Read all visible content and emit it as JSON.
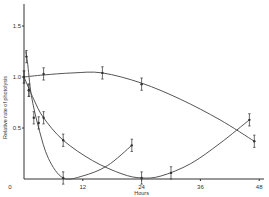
{
  "chart_data": {
    "type": "line",
    "title": "",
    "xlabel": "Hours",
    "ylabel": "Relative rate of photolysis",
    "xlim": [
      0,
      48
    ],
    "ylim": [
      0,
      1.5
    ],
    "x_ticks": [
      "0",
      "12",
      "24",
      "36",
      "48"
    ],
    "y_ticks": [
      "0",
      "0.5",
      "1.0",
      "1.5"
    ],
    "grid": false,
    "legend": null,
    "series": [
      {
        "name": "curve-a",
        "points": [
          [
            0,
            1.0
          ],
          [
            4,
            1.03
          ],
          [
            16,
            1.04
          ],
          [
            24,
            0.93
          ],
          [
            47,
            0.37
          ]
        ],
        "curve": [
          [
            0,
            1.0
          ],
          [
            4,
            1.02
          ],
          [
            10,
            1.04
          ],
          [
            16,
            1.04
          ],
          [
            24,
            0.94
          ],
          [
            32,
            0.78
          ],
          [
            40,
            0.58
          ],
          [
            47,
            0.37
          ]
        ]
      },
      {
        "name": "curve-b",
        "points": [
          [
            0.5,
            1.2
          ],
          [
            1,
            0.87
          ],
          [
            2,
            0.6
          ],
          [
            3,
            0.55
          ],
          [
            8,
            0.01
          ],
          [
            22,
            0.33
          ]
        ],
        "curve": [
          [
            0.3,
            1.25
          ],
          [
            0.7,
            1.15
          ],
          [
            1.5,
            0.82
          ],
          [
            3,
            0.5
          ],
          [
            5,
            0.2
          ],
          [
            8,
            0.01
          ],
          [
            12,
            0.03
          ],
          [
            17,
            0.13
          ],
          [
            22,
            0.33
          ]
        ]
      },
      {
        "name": "curve-c",
        "points": [
          [
            0,
            1.0
          ],
          [
            1,
            0.87
          ],
          [
            4,
            0.6
          ],
          [
            8,
            0.38
          ],
          [
            24,
            0.01
          ],
          [
            30,
            0.06
          ],
          [
            46,
            0.58
          ]
        ],
        "curve": [
          [
            0,
            1.0
          ],
          [
            2,
            0.78
          ],
          [
            4,
            0.6
          ],
          [
            8,
            0.38
          ],
          [
            14,
            0.18
          ],
          [
            20,
            0.05
          ],
          [
            24,
            0.01
          ],
          [
            28,
            0.03
          ],
          [
            34,
            0.15
          ],
          [
            40,
            0.35
          ],
          [
            46,
            0.58
          ]
        ]
      }
    ],
    "error_bar": 0.06
  }
}
